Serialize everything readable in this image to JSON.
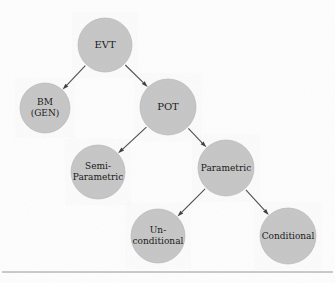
{
  "figure": {
    "type": "tree-diagram",
    "title": "",
    "background_color": "#fdfdfd",
    "node_fill_color": "#c6c6c6",
    "node_stroke_color": "#b0b0b0",
    "edge_color": "#4a4a4a",
    "text_color": "#1a1a1a",
    "divider_color": "#8a8a8a",
    "width": 335,
    "height": 283
  },
  "nodes": [
    {
      "id": "evt",
      "label": "EVT",
      "lines": [
        "EVT"
      ],
      "cx": 105,
      "cy": 45,
      "r": 27,
      "font_size": 10,
      "level": 0
    },
    {
      "id": "bm-gen",
      "label": "BM (GEN)",
      "lines": [
        "BM",
        "(GEN)"
      ],
      "cx": 45,
      "cy": 108,
      "r": 25,
      "font_size": 9,
      "level": 1
    },
    {
      "id": "pot",
      "label": "POT",
      "lines": [
        "POT"
      ],
      "cx": 168,
      "cy": 107,
      "r": 28,
      "font_size": 10,
      "level": 1
    },
    {
      "id": "semi-parametric",
      "label": "Semi-Parametric",
      "lines": [
        "Semi-",
        "Parametric"
      ],
      "cx": 98,
      "cy": 172,
      "r": 27,
      "font_size": 9,
      "level": 2
    },
    {
      "id": "parametric",
      "label": "Parametric",
      "lines": [
        "Parametric"
      ],
      "cx": 226,
      "cy": 168,
      "r": 28,
      "font_size": 9,
      "level": 2
    },
    {
      "id": "un-conditional",
      "label": "Un-conditional",
      "lines": [
        "Un-",
        "conditional"
      ],
      "cx": 158,
      "cy": 236,
      "r": 27,
      "font_size": 9,
      "level": 3
    },
    {
      "id": "conditional",
      "label": "Conditional",
      "lines": [
        "Conditional"
      ],
      "cx": 288,
      "cy": 236,
      "r": 28,
      "font_size": 9,
      "level": 3
    }
  ],
  "edges": [
    {
      "id": "evt-bm",
      "from": "evt",
      "to": "bm-gen",
      "arrow": true
    },
    {
      "id": "evt-pot",
      "from": "evt",
      "to": "pot",
      "arrow": true
    },
    {
      "id": "pot-semi",
      "from": "pot",
      "to": "semi-parametric",
      "arrow": true
    },
    {
      "id": "pot-parametric",
      "from": "pot",
      "to": "parametric",
      "arrow": true
    },
    {
      "id": "parametric-uncond",
      "from": "parametric",
      "to": "un-conditional",
      "arrow": true
    },
    {
      "id": "parametric-cond",
      "from": "parametric",
      "to": "conditional",
      "arrow": true
    }
  ],
  "divider": {
    "y": 272,
    "x1": 2,
    "x2": 333
  },
  "chart_data": {
    "type": "diagram",
    "title": "",
    "categories": [
      "EVT",
      "BM (GEN)",
      "POT",
      "Semi-Parametric",
      "Parametric",
      "Un-conditional",
      "Conditional"
    ],
    "hierarchy": {
      "EVT": [
        "BM (GEN)",
        "POT"
      ],
      "POT": [
        "Semi-Parametric",
        "Parametric"
      ],
      "Parametric": [
        "Un-conditional",
        "Conditional"
      ]
    }
  }
}
